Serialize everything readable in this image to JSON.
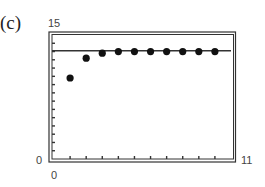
{
  "panel_label": "(c)",
  "axes": {
    "y_max_label": "15",
    "y_min_label": "0",
    "x_min_label": "0",
    "x_max_label": "11"
  },
  "colors": {
    "frame": "#333333",
    "line": "#333333",
    "points": "#111111",
    "ticks": "#333333"
  },
  "chart_data": {
    "type": "scatter",
    "title": "(c)",
    "xlabel": "",
    "ylabel": "",
    "xlim": [
      0,
      11
    ],
    "ylim": [
      0,
      15
    ],
    "x_ticks": [
      1,
      2,
      3,
      4,
      5,
      6,
      7,
      8,
      9,
      10
    ],
    "y_ticks": [
      1,
      2,
      3,
      4,
      5,
      6,
      7,
      8,
      9,
      10,
      11,
      12,
      13,
      14
    ],
    "tick_labels": {
      "x": [
        "0",
        "11"
      ],
      "y": [
        "0",
        "15"
      ]
    },
    "grid": false,
    "legend": null,
    "series": [
      {
        "name": "points",
        "type": "scatter",
        "x": [
          1,
          2,
          3,
          4,
          5,
          6,
          7,
          8,
          9,
          10
        ],
        "y": [
          9.8,
          12.2,
          12.8,
          13.0,
          13.0,
          13.0,
          13.0,
          13.0,
          13.0,
          13.0
        ]
      },
      {
        "name": "horizontal asymptote",
        "type": "line",
        "x": [
          0,
          11
        ],
        "y": [
          13.1,
          13.1
        ]
      }
    ]
  }
}
